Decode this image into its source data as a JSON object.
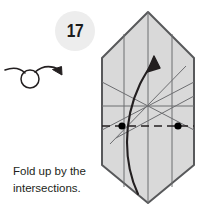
{
  "page": {
    "background_color": "#ffffff",
    "width": 201,
    "height": 213,
    "kind": "origami-instruction-step"
  },
  "step": {
    "number": "17",
    "badge_fill": "#ededed",
    "badge_text_color": "#1b1b1b"
  },
  "symbols": {
    "turn_over": {
      "name": "turn-over-arrow",
      "meaning": "Turn the model over",
      "stroke_color": "#231f20"
    },
    "fold_arrow": {
      "name": "valley-fold-arrow",
      "meaning": "Fold up",
      "stroke_color": "#231f20"
    }
  },
  "figure": {
    "name": "paper-model",
    "shape": "elongated-hexagon",
    "fill_color": "#d9d9d9",
    "outline_color": "#58595b",
    "crease_color": "#6d6e71",
    "fold_line_color": "#231f20",
    "marker_color": "#000000",
    "markers": [
      {
        "label": "left-intersection"
      },
      {
        "label": "right-intersection"
      }
    ],
    "fold_line_style": "dashed"
  },
  "caption": {
    "line1": "Fold up by the",
    "line2": "intersections.",
    "color": "#231f20"
  }
}
